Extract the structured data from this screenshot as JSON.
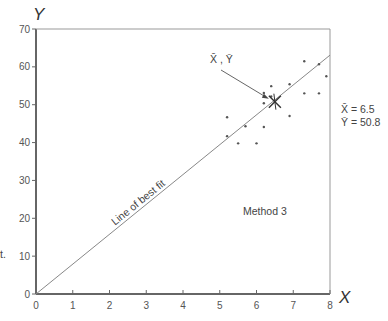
{
  "chart_data": {
    "type": "scatter",
    "title": "",
    "xlabel": "X",
    "ylabel": "Y",
    "xlim": [
      0,
      8
    ],
    "ylim": [
      0,
      70
    ],
    "grid": false,
    "x_ticks": [
      0,
      1,
      2,
      3,
      4,
      5,
      6,
      7,
      8
    ],
    "y_ticks": [
      0,
      10,
      20,
      30,
      40,
      50,
      60,
      70
    ],
    "series": [
      {
        "name": "Method 3 data",
        "points": [
          {
            "x": 5.2,
            "y": 46.7
          },
          {
            "x": 5.2,
            "y": 41.7
          },
          {
            "x": 5.5,
            "y": 39.8
          },
          {
            "x": 5.7,
            "y": 44.3
          },
          {
            "x": 6.0,
            "y": 39.8
          },
          {
            "x": 6.2,
            "y": 44.1
          },
          {
            "x": 6.2,
            "y": 50.4
          },
          {
            "x": 6.2,
            "y": 53.1
          },
          {
            "x": 6.4,
            "y": 52.2
          },
          {
            "x": 6.4,
            "y": 54.9
          },
          {
            "x": 6.9,
            "y": 47.0
          },
          {
            "x": 6.9,
            "y": 55.4
          },
          {
            "x": 7.3,
            "y": 53.0
          },
          {
            "x": 7.3,
            "y": 61.5
          },
          {
            "x": 7.7,
            "y": 60.7
          },
          {
            "x": 7.7,
            "y": 53.0
          },
          {
            "x": 7.9,
            "y": 57.5
          }
        ]
      }
    ],
    "best_fit_line": {
      "label": "Line of best fit",
      "x": [
        0,
        8
      ],
      "y": [
        0,
        63.1
      ]
    },
    "mean_point": {
      "label": "X̄ , Ȳ",
      "x": 6.5,
      "y": 50.8
    },
    "annotations": {
      "method": "Method 3",
      "x_mean": "X̄ =  6.5",
      "y_mean": "Ȳ =  50.8",
      "left_fragment": "t."
    }
  }
}
